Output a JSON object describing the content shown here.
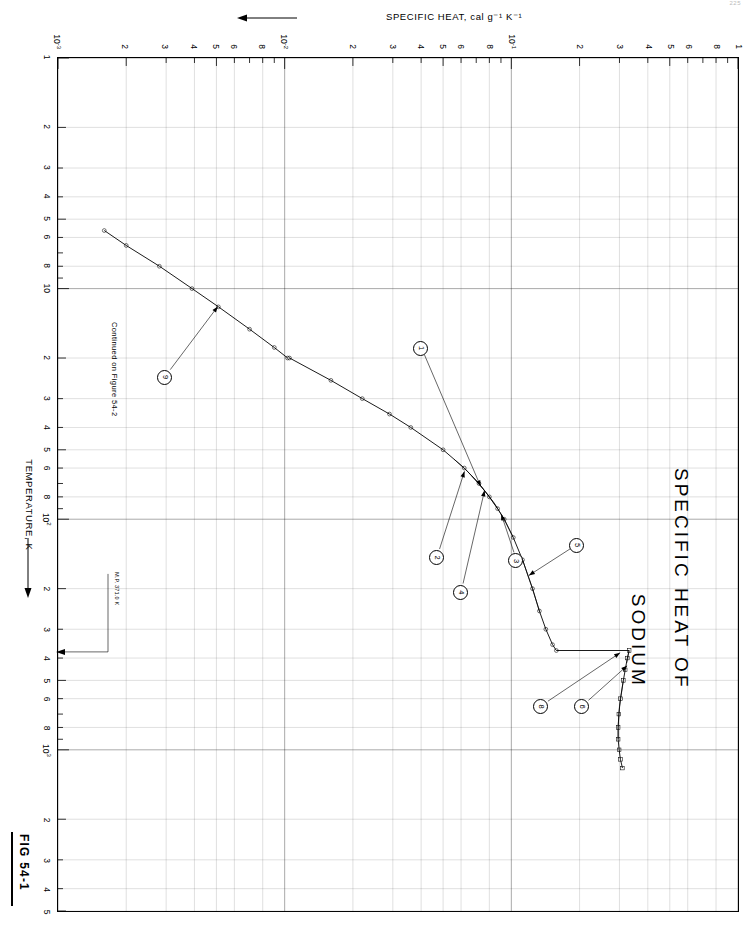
{
  "page_number": "225",
  "figure": {
    "label": "FIG  54-1",
    "title_line1": "SPECIFIC  HEAT  OF",
    "title_line2": "SODIUM",
    "continuation_note": "Continued on Figure  54-2",
    "melting_point_note": "M.P. 371.0 K"
  },
  "axes": {
    "x": {
      "title": "TEMPERATURE, K",
      "scale": "log",
      "min": 1,
      "max": 5000,
      "tick_labels": [
        "1",
        "2",
        "3",
        "4",
        "5",
        "6",
        "8",
        "10",
        "2",
        "3",
        "4",
        "5",
        "6",
        "8",
        "10²",
        "2",
        "3",
        "4",
        "5",
        "6",
        "8",
        "10³",
        "2",
        "3",
        "4",
        "5"
      ]
    },
    "y": {
      "title": "SPECIFIC  HEAT, cal g⁻¹ K⁻¹",
      "scale": "log",
      "min": 0.001,
      "max": 1.0,
      "tick_labels": [
        "10⁻³",
        "2",
        "3",
        "4",
        "5",
        "6",
        "8",
        "10⁻²",
        "2",
        "3",
        "4",
        "5",
        "6",
        "8",
        "10⁻¹",
        "2",
        "3",
        "4",
        "5",
        "6",
        "8",
        "1"
      ]
    }
  },
  "callouts": [
    {
      "id": "1",
      "label": "1"
    },
    {
      "id": "2",
      "label": "2"
    },
    {
      "id": "3",
      "label": "3"
    },
    {
      "id": "4",
      "label": "4"
    },
    {
      "id": "5",
      "label": "5"
    },
    {
      "id": "6",
      "label": "6"
    },
    {
      "id": "8",
      "label": "8"
    },
    {
      "id": "9",
      "label": "9"
    }
  ],
  "chart_data": {
    "type": "line",
    "title": "SPECIFIC HEAT OF SODIUM",
    "xlabel": "TEMPERATURE, K",
    "ylabel": "SPECIFIC HEAT, cal g⁻¹ K⁻¹",
    "xscale": "log",
    "yscale": "log",
    "xlim": [
      1,
      5000
    ],
    "ylim": [
      0.001,
      1.0
    ],
    "grid": true,
    "legend": "numbered-callouts",
    "annotations": [
      {
        "text": "M.P. 371.0 K",
        "x": 371.0,
        "kind": "vertical-marker"
      },
      {
        "text": "Continued on Figure  54-2",
        "kind": "note"
      }
    ],
    "series": [
      {
        "name": "9",
        "comment": "low-temperature branch, curves 5 K to 20 K",
        "x": [
          5.6,
          6.5,
          8.0,
          10.0,
          12.0,
          15.0,
          18.0,
          20.0
        ],
        "y": [
          0.0016,
          0.002,
          0.0028,
          0.0039,
          0.0051,
          0.007,
          0.009,
          0.0103
        ]
      },
      {
        "name": "curve-main-solid",
        "comment": "main solid-phase curve from 20 K through the knee to melting point",
        "x": [
          20,
          25,
          30,
          35,
          40,
          50,
          60,
          70,
          80,
          90,
          100,
          120,
          150,
          200,
          250,
          300,
          350,
          371
        ],
        "y": [
          0.0105,
          0.016,
          0.022,
          0.029,
          0.036,
          0.05,
          0.062,
          0.072,
          0.08,
          0.087,
          0.093,
          0.102,
          0.112,
          0.124,
          0.133,
          0.142,
          0.152,
          0.158
        ]
      },
      {
        "name": "curve-liquid",
        "comment": "liquid-phase branch above the melting point, 371 K to 1200 K",
        "x": [
          371,
          400,
          450,
          500,
          600,
          700,
          800,
          900,
          1000,
          1100,
          1200
        ],
        "y": [
          0.331,
          0.325,
          0.318,
          0.312,
          0.303,
          0.298,
          0.296,
          0.296,
          0.299,
          0.303,
          0.309
        ]
      },
      {
        "name": "1",
        "comment": "data set near the 70-90 K knee",
        "x": [
          70,
          80,
          90
        ],
        "y": [
          0.072,
          0.08,
          0.087
        ]
      },
      {
        "name": "2",
        "comment": "data set just below the knee",
        "x": [
          55,
          62,
          70
        ],
        "y": [
          0.056,
          0.064,
          0.072
        ]
      },
      {
        "name": "3",
        "comment": "data set on the knee",
        "x": [
          85,
          100,
          120
        ],
        "y": [
          0.084,
          0.093,
          0.102
        ]
      },
      {
        "name": "4",
        "comment": "data set near the knee",
        "x": [
          65,
          75,
          85
        ],
        "y": [
          0.067,
          0.076,
          0.084
        ]
      },
      {
        "name": "5",
        "comment": "data set on the 150-250 K segment",
        "x": [
          150,
          200,
          250
        ],
        "y": [
          0.112,
          0.124,
          0.133
        ]
      },
      {
        "name": "6",
        "comment": "liquid-phase data set 500-900 K",
        "x": [
          500,
          650,
          800,
          900
        ],
        "y": [
          0.312,
          0.3,
          0.296,
          0.296
        ]
      },
      {
        "name": "8",
        "comment": "data set at and just above melting",
        "x": [
          371,
          390,
          420
        ],
        "y": [
          0.331,
          0.328,
          0.323
        ]
      }
    ]
  }
}
